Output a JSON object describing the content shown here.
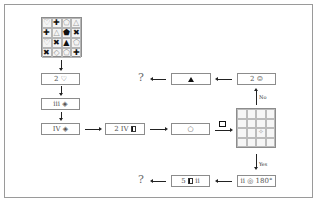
{
  "diagram": {
    "type": "flowchart-puzzle",
    "source_grid": {
      "rows": [
        [
          "♡",
          "✚",
          "⬠",
          "△"
        ],
        [
          "✚",
          "△",
          "⬟",
          "✖"
        ],
        [
          "♡",
          "✖",
          "▲",
          "⬠"
        ],
        [
          "✖",
          "◇",
          "⬠",
          "✚"
        ]
      ],
      "hollow": [
        [
          true,
          false,
          true,
          true
        ],
        [
          false,
          true,
          false,
          false
        ],
        [
          true,
          false,
          false,
          true
        ],
        [
          false,
          true,
          true,
          false
        ]
      ]
    },
    "left_column": [
      {
        "text": "2 ♡"
      },
      {
        "text": "iii ◈"
      },
      {
        "text": "IV ◈"
      }
    ],
    "middle_row": [
      {
        "text": "2 IV",
        "suffix_icon": "half-filled-square-icon"
      },
      {
        "text": "○"
      }
    ],
    "operation_icon": "square-stamp-icon",
    "target_grid": {
      "rows": 4,
      "cols": 4,
      "marked_cell": {
        "row": 2,
        "col": 2,
        "symbol": "✧"
      }
    },
    "branch_no": {
      "label": "No",
      "boxes": [
        {
          "text": "2 ☺"
        },
        {
          "symbol": "▲"
        }
      ],
      "result": "?"
    },
    "branch_yes": {
      "label": "Yes",
      "boxes": [
        {
          "text": "ii ◎ 180°"
        },
        {
          "prefix": "5",
          "suffix": "ii",
          "icon": "half-filled-square-icon"
        }
      ],
      "result": "?"
    }
  }
}
